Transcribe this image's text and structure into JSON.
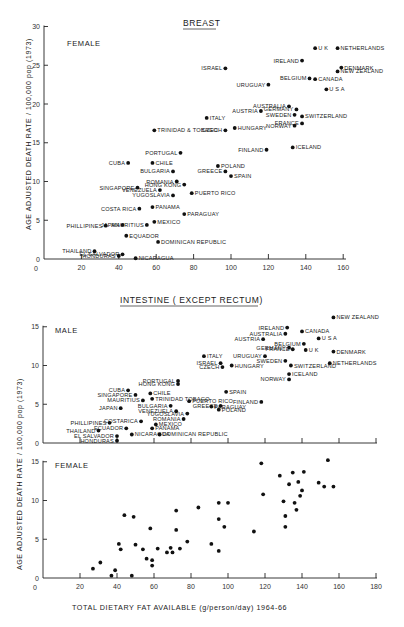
{
  "chart_data": [
    {
      "type": "scatter",
      "title": "BREAST",
      "subtitle": "FEMALE",
      "xlabel": "",
      "ylabel": "AGE ADJUSTED DEATH RATE / 100,000 pop (1973)",
      "xlim": [
        0,
        160
      ],
      "ylim": [
        0,
        30
      ],
      "xticks": [
        20,
        40,
        60,
        80,
        100,
        120,
        140,
        160
      ],
      "yticks": [
        0,
        5,
        10,
        15,
        20,
        25,
        30
      ],
      "grid": false,
      "points": [
        {
          "label": "U K",
          "x": 145,
          "y": 27.2
        },
        {
          "label": "NETHERLANDS",
          "x": 157,
          "y": 27.2
        },
        {
          "label": "IRELAND",
          "x": 138,
          "y": 25.6
        },
        {
          "label": "ISRAEL",
          "x": 97,
          "y": 24.6
        },
        {
          "label": "DENMARK",
          "x": 159,
          "y": 24.7
        },
        {
          "label": "NEW ZEALAND",
          "x": 157,
          "y": 24.2
        },
        {
          "label": "BELGIUM",
          "x": 142,
          "y": 23.3
        },
        {
          "label": "CANADA",
          "x": 145,
          "y": 23.2
        },
        {
          "label": "URUGUAY",
          "x": 120,
          "y": 22.5
        },
        {
          "label": "U S A",
          "x": 151,
          "y": 21.9
        },
        {
          "label": "AUSTRIA",
          "x": 116,
          "y": 19.1
        },
        {
          "label": "AUSTRALIA",
          "x": 131,
          "y": 19.7
        },
        {
          "label": "GERMANY",
          "x": 135,
          "y": 19.3
        },
        {
          "label": "SWEDEN",
          "x": 134,
          "y": 18.6
        },
        {
          "label": "SWITZERLAND",
          "x": 138,
          "y": 18.4
        },
        {
          "label": "ITALY",
          "x": 87,
          "y": 18.2
        },
        {
          "label": "NORWAY",
          "x": 134,
          "y": 17.2
        },
        {
          "label": "FRANCE",
          "x": 138,
          "y": 17.5
        },
        {
          "label": "HUNGARY",
          "x": 102,
          "y": 16.9
        },
        {
          "label": "CZECH",
          "x": 97,
          "y": 16.6
        },
        {
          "label": "TRINIDAD & TOBAGO",
          "x": 59,
          "y": 16.6
        },
        {
          "label": "ICELAND",
          "x": 133,
          "y": 14.4
        },
        {
          "label": "FINLAND",
          "x": 119,
          "y": 14.1
        },
        {
          "label": "PORTUGAL",
          "x": 73,
          "y": 13.7
        },
        {
          "label": "CUBA",
          "x": 45,
          "y": 12.4
        },
        {
          "label": "CHILE",
          "x": 58,
          "y": 12.4
        },
        {
          "label": "POLAND",
          "x": 93,
          "y": 12.0
        },
        {
          "label": "GREECE",
          "x": 97,
          "y": 11.3
        },
        {
          "label": "BULGARIA",
          "x": 69,
          "y": 11.3
        },
        {
          "label": "SPAIN",
          "x": 100,
          "y": 10.7
        },
        {
          "label": "ROMANIA",
          "x": 71,
          "y": 10.0
        },
        {
          "label": "HONG KONG",
          "x": 75,
          "y": 9.6
        },
        {
          "label": "SINGAPORE",
          "x": 50,
          "y": 9.2
        },
        {
          "label": "VENEZUELA",
          "x": 62,
          "y": 8.9
        },
        {
          "label": "PUERTO RICO",
          "x": 79,
          "y": 8.5
        },
        {
          "label": "YUGOSLAVIA",
          "x": 69,
          "y": 8.2
        },
        {
          "label": "PANAMA",
          "x": 58,
          "y": 6.7
        },
        {
          "label": "COSTA RICA",
          "x": 51,
          "y": 6.5
        },
        {
          "label": "PARAGUAY",
          "x": 75,
          "y": 5.8
        },
        {
          "label": "MEXICO",
          "x": 59,
          "y": 4.8
        },
        {
          "label": "JAPAN",
          "x": 42,
          "y": 4.4
        },
        {
          "label": "MAURITIUS",
          "x": 55,
          "y": 4.4
        },
        {
          "label": "PHILLIPINES",
          "x": 33,
          "y": 4.3
        },
        {
          "label": "EQUADOR",
          "x": 44,
          "y": 3.0
        },
        {
          "label": "DOMINICAN REPUBLIC",
          "x": 61,
          "y": 2.2
        },
        {
          "label": "THAILAND",
          "x": 27,
          "y": 1.0
        },
        {
          "label": "EL SALVADOR",
          "x": 42,
          "y": 0.6
        },
        {
          "label": "HONDURAS",
          "x": 40,
          "y": 0.4
        },
        {
          "label": "NICARAGUA",
          "x": 49,
          "y": 0.1
        }
      ]
    },
    {
      "type": "scatter",
      "title": "INTESTINE (EXCEPT RECTUM)",
      "subtitle": "MALE",
      "xlabel": "",
      "ylabel": "AGE ADJUSTED DEATH RATE / 100,000 pop (1973)",
      "xlim": [
        0,
        180
      ],
      "ylim": [
        0,
        15
      ],
      "xticks": [
        20,
        40,
        60,
        80,
        100,
        120,
        140,
        160,
        180
      ],
      "yticks": [
        0,
        5,
        10,
        15
      ],
      "grid": false,
      "points": [
        {
          "label": "NEW ZEALAND",
          "x": 157,
          "y": 16.2
        },
        {
          "label": "IRELAND",
          "x": 132,
          "y": 14.9
        },
        {
          "label": "CANADA",
          "x": 140,
          "y": 14.4
        },
        {
          "label": "AUSTRALIA",
          "x": 131,
          "y": 14.1
        },
        {
          "label": "U S A",
          "x": 149,
          "y": 13.5
        },
        {
          "label": "AUSTRIA",
          "x": 119,
          "y": 13.4
        },
        {
          "label": "BELGIUM",
          "x": 141,
          "y": 12.8
        },
        {
          "label": "GERMANY",
          "x": 133,
          "y": 12.3
        },
        {
          "label": "U K",
          "x": 142,
          "y": 12.0
        },
        {
          "label": "FRANCE",
          "x": 135,
          "y": 12.1
        },
        {
          "label": "DENMARK",
          "x": 157,
          "y": 11.8
        },
        {
          "label": "URUGUAY",
          "x": 120,
          "y": 11.2
        },
        {
          "label": "SWEDEN",
          "x": 131,
          "y": 10.6
        },
        {
          "label": "NETHERLANDS",
          "x": 155,
          "y": 10.3
        },
        {
          "label": "SWITZERLAND",
          "x": 134,
          "y": 10.0
        },
        {
          "label": "ITALY",
          "x": 87,
          "y": 11.2
        },
        {
          "label": "ISRAEL",
          "x": 96,
          "y": 10.3
        },
        {
          "label": "HUNGARY",
          "x": 102,
          "y": 10.0
        },
        {
          "label": "CZECH",
          "x": 97,
          "y": 9.8
        },
        {
          "label": "ICELAND",
          "x": 133,
          "y": 8.9
        },
        {
          "label": "NORWAY",
          "x": 133,
          "y": 8.2
        },
        {
          "label": "PORTUGAL",
          "x": 73,
          "y": 8.0
        },
        {
          "label": "HONG KONG",
          "x": 73,
          "y": 7.6
        },
        {
          "label": "SPAIN",
          "x": 99,
          "y": 6.6
        },
        {
          "label": "CUBA",
          "x": 46,
          "y": 6.8
        },
        {
          "label": "CHILE",
          "x": 58,
          "y": 6.4
        },
        {
          "label": "SINGAPORE",
          "x": 50,
          "y": 6.2
        },
        {
          "label": "TRINIDAD TOBAGO",
          "x": 59,
          "y": 5.7
        },
        {
          "label": "FINLAND",
          "x": 118,
          "y": 5.3
        },
        {
          "label": "PUERTO RICO",
          "x": 79,
          "y": 5.4
        },
        {
          "label": "MAURITIUS",
          "x": 54,
          "y": 5.5
        },
        {
          "label": "PARAGUAY",
          "x": 91,
          "y": 4.7
        },
        {
          "label": "GREECE",
          "x": 96,
          "y": 4.8
        },
        {
          "label": "POLAND",
          "x": 95,
          "y": 4.3
        },
        {
          "label": "JAPAN",
          "x": 42,
          "y": 4.5
        },
        {
          "label": "BULGARIA",
          "x": 69,
          "y": 4.8
        },
        {
          "label": "YUGOSLAVIA",
          "x": 78,
          "y": 3.8
        },
        {
          "label": "VENEZUELA",
          "x": 72,
          "y": 4.1
        },
        {
          "label": "ROMANIA",
          "x": 76,
          "y": 3.1
        },
        {
          "label": "PHILLIPINES",
          "x": 36,
          "y": 2.6
        },
        {
          "label": "COSTARICA",
          "x": 53,
          "y": 2.8
        },
        {
          "label": "MEXICO",
          "x": 61,
          "y": 2.4
        },
        {
          "label": "ECUADOR",
          "x": 45,
          "y": 1.9
        },
        {
          "label": "THAILAND",
          "x": 30,
          "y": 1.6
        },
        {
          "label": "PANAMA",
          "x": 59,
          "y": 1.9
        },
        {
          "label": "EL SALVADOR",
          "x": 40,
          "y": 0.9
        },
        {
          "label": "HONDURAS",
          "x": 40,
          "y": 0.3
        },
        {
          "label": "NICARAGUA",
          "x": 48,
          "y": 1.1
        },
        {
          "label": "DOMINICAN REPUBLIC",
          "x": 63,
          "y": 1.1
        }
      ]
    },
    {
      "type": "scatter",
      "title": "",
      "subtitle": "FEMALE",
      "xlabel": "TOTAL DIETARY FAT AVAILABLE (g/person/day) 1964-66",
      "ylabel": "AGE ADJUSTED DEATH RATE / 100,000 pop (1973)",
      "xlim": [
        0,
        180
      ],
      "ylim": [
        0,
        15
      ],
      "xticks": [
        20,
        40,
        60,
        80,
        100,
        120,
        140,
        160,
        180
      ],
      "yticks": [
        0,
        5,
        10,
        15
      ],
      "grid": false,
      "points": [
        {
          "x": 27,
          "y": 1.2
        },
        {
          "x": 31,
          "y": 2.0
        },
        {
          "x": 37,
          "y": 0.3
        },
        {
          "x": 39,
          "y": 1.0
        },
        {
          "x": 41,
          "y": 4.4
        },
        {
          "x": 42,
          "y": 3.7
        },
        {
          "x": 44,
          "y": 8.1
        },
        {
          "x": 48,
          "y": 0.3
        },
        {
          "x": 49,
          "y": 7.9
        },
        {
          "x": 50,
          "y": 4.3
        },
        {
          "x": 54,
          "y": 3.7
        },
        {
          "x": 56,
          "y": 2.5
        },
        {
          "x": 58,
          "y": 6.4
        },
        {
          "x": 59,
          "y": 2.3
        },
        {
          "x": 59,
          "y": 1.6
        },
        {
          "x": 62,
          "y": 3.8
        },
        {
          "x": 67,
          "y": 3.3
        },
        {
          "x": 69,
          "y": 3.9
        },
        {
          "x": 70,
          "y": 3.3
        },
        {
          "x": 72,
          "y": 6.2
        },
        {
          "x": 72,
          "y": 8.7
        },
        {
          "x": 74,
          "y": 3.8
        },
        {
          "x": 78,
          "y": 4.7
        },
        {
          "x": 84,
          "y": 9.1
        },
        {
          "x": 91,
          "y": 4.4
        },
        {
          "x": 95,
          "y": 3.5
        },
        {
          "x": 95,
          "y": 7.6
        },
        {
          "x": 95,
          "y": 9.7
        },
        {
          "x": 98,
          "y": 6.6
        },
        {
          "x": 100,
          "y": 9.7
        },
        {
          "x": 114,
          "y": 6.0
        },
        {
          "x": 118,
          "y": 14.8
        },
        {
          "x": 119,
          "y": 10.8
        },
        {
          "x": 128,
          "y": 13.2
        },
        {
          "x": 130,
          "y": 9.9
        },
        {
          "x": 131,
          "y": 6.6
        },
        {
          "x": 131,
          "y": 8.0
        },
        {
          "x": 133,
          "y": 12.1
        },
        {
          "x": 135,
          "y": 13.6
        },
        {
          "x": 136,
          "y": 9.7
        },
        {
          "x": 137,
          "y": 8.8
        },
        {
          "x": 138,
          "y": 12.4
        },
        {
          "x": 139,
          "y": 10.6
        },
        {
          "x": 140,
          "y": 11.3
        },
        {
          "x": 141,
          "y": 13.7
        },
        {
          "x": 149,
          "y": 12.3
        },
        {
          "x": 152,
          "y": 11.8
        },
        {
          "x": 154,
          "y": 15.2
        },
        {
          "x": 157,
          "y": 11.8
        }
      ]
    }
  ],
  "figure": {
    "breast_title": "BREAST",
    "breast_sex": "FEMALE",
    "intestine_title": "INTESTINE ( EXCEPT RECTUM)",
    "intestine_male": "MALE",
    "intestine_female": "FEMALE",
    "ylabel_top": "AGE ADJUSTED DEATH RATE / 100,000 pop (1973)",
    "ylabel_bottom": "AGE ADJUSTED DEATH RATE / 100,000 pop (1973)",
    "xlabel": "TOTAL  DIETARY FAT AVAILABLE (g/person/day) 1964-66",
    "zero": "0"
  }
}
